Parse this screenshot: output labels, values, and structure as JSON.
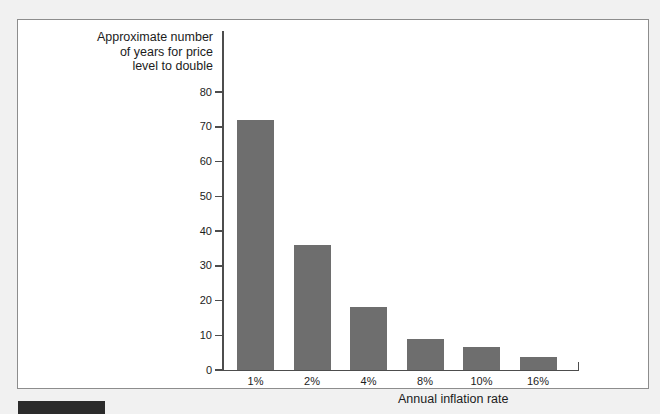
{
  "chart_data": {
    "type": "bar",
    "title": "",
    "ylabel": "Approximate number\nof years for price\nlevel to double",
    "xlabel": "Annual inflation rate",
    "categories": [
      "1%",
      "2%",
      "4%",
      "8%",
      "10%",
      "16%"
    ],
    "values": [
      72,
      36,
      18,
      9,
      6.5,
      3.7
    ],
    "ylim": [
      0,
      80
    ],
    "yticks": [
      0,
      10,
      20,
      30,
      40,
      50,
      60,
      70,
      80
    ],
    "ytick_labels": [
      "0",
      "10",
      "20",
      "30",
      "40",
      "50",
      "60",
      "70",
      "80"
    ],
    "grid": false,
    "legend": false,
    "bar_color": "#6e6e6e",
    "axis_color": "#4d4d4d",
    "text_color": "#1c1c1c",
    "background": "#ffffff",
    "page_background": "#f1f1f1"
  },
  "figure": {
    "caption_bar_color": "#2b2b2b"
  }
}
